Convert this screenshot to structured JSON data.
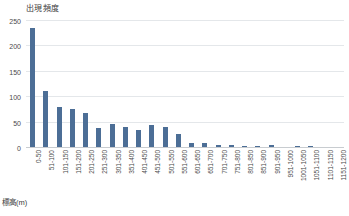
{
  "chart_data": {
    "type": "bar",
    "title": "出現頻度",
    "xlabel": "標高(m)",
    "ylabel": "",
    "ylim": [
      0,
      250
    ],
    "yticks": [
      0,
      50,
      100,
      150,
      200,
      250
    ],
    "grid": true,
    "legend": "none",
    "bar_color": "#4c6e96",
    "grid_color": "#e4e7ea",
    "categories": [
      "0-50",
      "51-100",
      "101-150",
      "151-200",
      "201-250",
      "251-300",
      "301-350",
      "351-400",
      "401-450",
      "451-500",
      "501-550",
      "551-600",
      "601-650",
      "651-700",
      "701-750",
      "751-800",
      "801-850",
      "851-900",
      "901-950",
      "951-1000",
      "1001-1050",
      "1051-1100",
      "1101-1150",
      "1151-1200"
    ],
    "values": [
      235,
      110,
      79,
      74,
      66,
      37,
      45,
      40,
      33,
      43,
      40,
      25,
      8,
      7,
      3,
      3,
      2,
      2,
      4,
      0,
      2,
      2,
      0,
      0
    ]
  }
}
